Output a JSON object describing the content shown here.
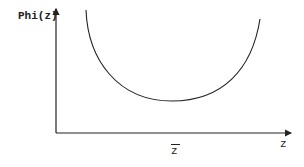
{
  "diagram": {
    "y_axis_label": "Phi(z)",
    "x_axis_label": "z",
    "marker_label": "z",
    "marker_overline": true,
    "colors": {
      "stroke": "#222222",
      "background": "#ffffff"
    },
    "curve": {
      "shape": "U-shaped convex curve",
      "left_top": [
        86,
        10
      ],
      "minimum": [
        172,
        101
      ],
      "right_top": [
        260,
        19
      ]
    },
    "axes": {
      "origin": [
        56,
        133
      ],
      "y_axis_top": [
        56,
        8
      ],
      "x_axis_end": [
        292,
        133
      ]
    }
  }
}
